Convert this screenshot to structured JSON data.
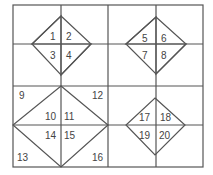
{
  "diagram": {
    "type": "grid-with-diamonds",
    "line_color": "#555555",
    "text_color": "#444444",
    "grid": {
      "columns": 4,
      "rows": 4
    },
    "regions": [
      {
        "name": "top-left",
        "labels": [
          "1",
          "2",
          "3",
          "4"
        ]
      },
      {
        "name": "top-right",
        "labels": [
          "5",
          "6",
          "7",
          "8"
        ]
      },
      {
        "name": "bottom-left",
        "labels": [
          "9",
          "10",
          "11",
          "12",
          "13",
          "14",
          "15",
          "16"
        ]
      },
      {
        "name": "bottom-right",
        "labels": [
          "17",
          "18",
          "19",
          "20"
        ]
      }
    ],
    "labels": {
      "n1": "1",
      "n2": "2",
      "n3": "3",
      "n4": "4",
      "n5": "5",
      "n6": "6",
      "n7": "7",
      "n8": "8",
      "n9": "9",
      "n10": "10",
      "n11": "11",
      "n12": "12",
      "n13": "13",
      "n14": "14",
      "n15": "15",
      "n16": "16",
      "n17": "17",
      "n18": "18",
      "n19": "19",
      "n20": "20"
    }
  }
}
